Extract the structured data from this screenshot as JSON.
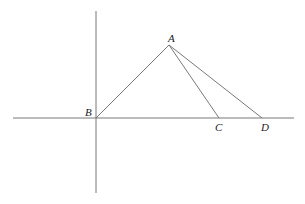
{
  "diagram": {
    "type": "geometry-figure",
    "colors": {
      "line": "#6a6a6a",
      "label": "#222222",
      "background": "#ffffff"
    },
    "axes": {
      "horizontal": {
        "x1": 13,
        "y1": 118,
        "x2": 294,
        "y2": 118
      },
      "vertical": {
        "x1": 96,
        "y1": 11,
        "x2": 96,
        "y2": 193
      }
    },
    "points": {
      "A": {
        "label": "A",
        "x": 169,
        "y": 45,
        "label_x": 168,
        "label_y": 42
      },
      "B": {
        "label": "B",
        "x": 96,
        "y": 118,
        "label_x": 85,
        "label_y": 116
      },
      "C": {
        "label": "C",
        "x": 219,
        "y": 118,
        "label_x": 215,
        "label_y": 131
      },
      "D": {
        "label": "D",
        "x": 262,
        "y": 118,
        "label_x": 261,
        "label_y": 131
      }
    },
    "segments": [
      {
        "name": "AB",
        "from": "A",
        "to": "B"
      },
      {
        "name": "AC",
        "from": "A",
        "to": "C"
      },
      {
        "name": "AD",
        "from": "A",
        "to": "D"
      }
    ]
  }
}
